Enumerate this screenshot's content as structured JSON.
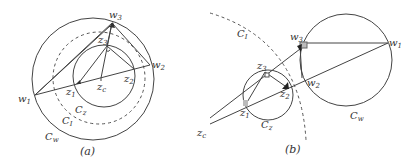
{
  "panels": {
    "a": {
      "caption": "(a)",
      "labels": {
        "w1": "w1",
        "w2": "w2",
        "w3": "w3",
        "z1": "z1",
        "z2": "z2",
        "z3": "z3",
        "zc": "zc",
        "Cz": "Cz",
        "CI": "CI",
        "Cw": "Cw"
      }
    },
    "b": {
      "caption": "(b)",
      "labels": {
        "w1": "w1",
        "w2": "w2",
        "w3": "w3",
        "z1": "z1",
        "z2": "z2",
        "z3": "z3",
        "zc": "zc",
        "Cz": "Cz",
        "CI": "CI",
        "Cw": "Cw"
      }
    }
  },
  "colors": {
    "stroke": "#444444",
    "dashed": "#555555",
    "marker_gray": "#aaaaaa",
    "marker_dark": "#222222"
  }
}
